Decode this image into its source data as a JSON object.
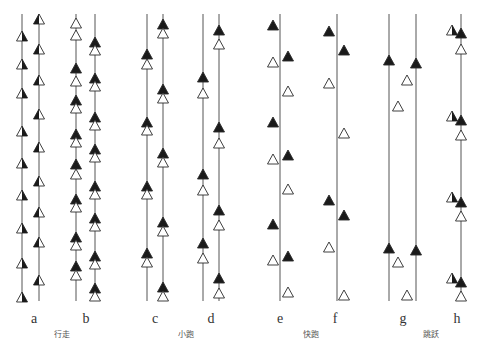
{
  "figure": {
    "title": "",
    "legend": {
      "filled_triangle": "black foot",
      "open_triangle": "white foot"
    },
    "line_top": 14,
    "line_bottom": 301,
    "columns": [
      {
        "id": "a",
        "label": "a",
        "label_x": 34,
        "lines": [
          22,
          39
        ],
        "marks": [
          {
            "x": 22,
            "y": [
              36,
              64,
              93,
              131,
              163,
              195,
              228,
              263,
              297
            ],
            "style": "half-right-black"
          },
          {
            "x": 39,
            "y": [
              19,
              49,
              80,
              114,
              147,
              181,
              212,
              242,
              280
            ],
            "style": "half-left-black"
          }
        ]
      },
      {
        "id": "b",
        "label": "b",
        "label_x": 86,
        "lines": [
          76,
          95
        ],
        "marks": [
          {
            "x": 76,
            "y": [
              23,
              35,
              68,
              81,
              100,
              108,
              134,
              142,
              164,
              174,
              199,
              207,
              237,
              245,
              266,
              275
            ],
            "style": "pair-v"
          },
          {
            "x": 95,
            "y": [
              42,
              50,
              78,
              86,
              117,
              125,
              149,
              157,
              186,
              194,
              218,
              226,
              256,
              264,
              288,
              296
            ],
            "style": "pair-v2"
          }
        ]
      },
      {
        "id": "c",
        "label": "c",
        "label_x": 155,
        "lines": [
          147,
          163
        ],
        "marks": [
          {
            "x": 147,
            "y": [
              54,
              64,
              122,
              130,
              186,
              194,
              253,
              262
            ],
            "style": "pair"
          },
          {
            "x": 163,
            "y": [
              24,
              33,
              89,
              98,
              153,
              162,
              222,
              231,
              287,
              296
            ],
            "style": "pair"
          }
        ]
      },
      {
        "id": "d",
        "label": "d",
        "label_x": 211,
        "lines": [
          203,
          219
        ],
        "marks": [
          {
            "x": 203,
            "y": [
              77,
              93,
              174,
              190,
              243,
              258
            ],
            "style": "pair-gap"
          },
          {
            "x": 219,
            "y": [
              30,
              44,
              127,
              143,
              210,
              225,
              278,
              293
            ],
            "style": "pair-gap"
          }
        ]
      },
      {
        "id": "e",
        "label": "e",
        "label_x": 280,
        "lines": [
          280
        ],
        "marks": [
          {
            "x": 273,
            "y": [
              25,
              62,
              122,
              159,
              224,
              260
            ],
            "fill": [
              "black",
              "white",
              "black",
              "white",
              "black",
              "white"
            ]
          },
          {
            "x": 288,
            "y": [
              56,
              91,
              155,
              189,
              256,
              292
            ],
            "fill": [
              "black",
              "white",
              "black",
              "white",
              "black",
              "white"
            ]
          }
        ]
      },
      {
        "id": "f",
        "label": "f",
        "label_x": 335,
        "lines": [
          337
        ],
        "marks": [
          {
            "x": 329,
            "y": [
              31,
              83,
              200,
              247
            ],
            "fill": [
              "black",
              "white",
              "black",
              "white"
            ]
          },
          {
            "x": 344,
            "y": [
              50,
              133,
              215,
              295
            ],
            "fill": [
              "black",
              "white",
              "black",
              "white"
            ]
          }
        ]
      },
      {
        "id": "g",
        "label": "g",
        "label_x": 403,
        "lines": [
          389,
          416
        ],
        "marks": [
          {
            "x": 389,
            "y": [
              60,
              248
            ],
            "fill": [
              "black",
              "black"
            ]
          },
          {
            "x": 416,
            "y": [
              63,
              250
            ],
            "fill": [
              "black",
              "black"
            ]
          },
          {
            "x": 407,
            "y": [
              80,
              295
            ],
            "fill": [
              "white",
              "white"
            ]
          },
          {
            "x": 398,
            "y": [
              106,
              262
            ],
            "fill": [
              "white",
              "white"
            ]
          }
        ]
      },
      {
        "id": "h",
        "label": "h",
        "label_x": 457,
        "lines": [
          461
        ],
        "marks": [
          {
            "x": 452,
            "y": [
              30,
              116,
              197,
              278
            ],
            "style": "half-left-white-right-black-small"
          },
          {
            "x": 461,
            "y": [
              33,
              120,
              202,
              282
            ],
            "fill": [
              "black",
              "black",
              "black",
              "black"
            ]
          },
          {
            "x": 461,
            "y": [
              49,
              135,
              216,
              296
            ],
            "fill": [
              "white",
              "white",
              "white",
              "white"
            ]
          }
        ]
      }
    ],
    "groups": [
      {
        "label": "行走",
        "x": 62
      },
      {
        "label": "小跑",
        "x": 186
      },
      {
        "label": "快跑",
        "x": 311
      },
      {
        "label": "跳跃",
        "x": 431
      }
    ]
  }
}
